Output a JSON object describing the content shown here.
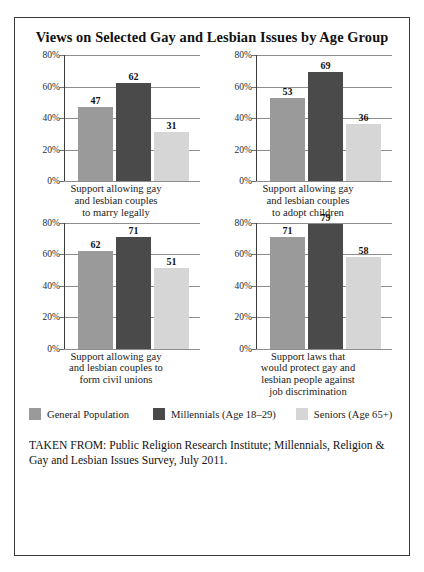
{
  "figure": {
    "title": "Views on Selected Gay and Lesbian Issues by Age Group",
    "source_caption": "TAKEN FROM: Public Religion Research Institute; Millennials, Religion & Gay and Lesbian Issues Survey, July 2011."
  },
  "legend": {
    "items": [
      {
        "label": "General Population",
        "color": "#9a9a9a"
      },
      {
        "label": "Millennials (Age 18–29)",
        "color": "#4a4a4a"
      },
      {
        "label": "Seniors (Age 65+)",
        "color": "#d6d6d6"
      }
    ]
  },
  "axis": {
    "ticks": [
      "80%",
      "60%",
      "40%",
      "20%",
      "0%"
    ]
  },
  "chart_data": [
    {
      "type": "bar",
      "title": "Support allowing gay and lesbian couples to marry legally",
      "caption_lines": [
        "Support allowing gay",
        "and lesbian couples",
        "to marry legally"
      ],
      "categories": [
        "General Population",
        "Millennials (Age 18–29)",
        "Seniors (Age 65+)"
      ],
      "values": [
        47,
        62,
        31
      ],
      "colors": [
        "#9a9a9a",
        "#4a4a4a",
        "#d6d6d6"
      ],
      "xlabel": "",
      "ylabel": "",
      "ylim": [
        0,
        80
      ],
      "yticks": [
        0,
        20,
        40,
        60,
        80
      ],
      "ytick_labels": [
        "0%",
        "20%",
        "40%",
        "60%",
        "80%"
      ],
      "grid": true,
      "legend_position": "bottom"
    },
    {
      "type": "bar",
      "title": "Support allowing gay and lesbian couples to adopt children",
      "caption_lines": [
        "Support allowing gay",
        "and lesbian couples",
        "to adopt children"
      ],
      "categories": [
        "General Population",
        "Millennials (Age 18–29)",
        "Seniors (Age 65+)"
      ],
      "values": [
        53,
        69,
        36
      ],
      "colors": [
        "#9a9a9a",
        "#4a4a4a",
        "#d6d6d6"
      ],
      "xlabel": "",
      "ylabel": "",
      "ylim": [
        0,
        80
      ],
      "yticks": [
        0,
        20,
        40,
        60,
        80
      ],
      "ytick_labels": [
        "0%",
        "20%",
        "40%",
        "60%",
        "80%"
      ],
      "grid": true,
      "legend_position": "bottom"
    },
    {
      "type": "bar",
      "title": "Support allowing gay and lesbian couples to form civil unions",
      "caption_lines": [
        "Support allowing gay",
        "and lesbian couples to",
        "form civil unions"
      ],
      "categories": [
        "General Population",
        "Millennials (Age 18–29)",
        "Seniors (Age 65+)"
      ],
      "values": [
        62,
        71,
        51
      ],
      "colors": [
        "#9a9a9a",
        "#4a4a4a",
        "#d6d6d6"
      ],
      "xlabel": "",
      "ylabel": "",
      "ylim": [
        0,
        80
      ],
      "yticks": [
        0,
        20,
        40,
        60,
        80
      ],
      "ytick_labels": [
        "0%",
        "20%",
        "40%",
        "60%",
        "80%"
      ],
      "grid": true,
      "legend_position": "bottom"
    },
    {
      "type": "bar",
      "title": "Support laws that would protect gay and lesbian people against job discrimination",
      "caption_lines": [
        "Support laws that",
        "would protect gay and",
        "lesbian people against",
        "job discrimination"
      ],
      "categories": [
        "General Population",
        "Millennials (Age 18–29)",
        "Seniors (Age 65+)"
      ],
      "values": [
        71,
        79,
        58
      ],
      "colors": [
        "#9a9a9a",
        "#4a4a4a",
        "#d6d6d6"
      ],
      "xlabel": "",
      "ylabel": "",
      "ylim": [
        0,
        80
      ],
      "yticks": [
        0,
        20,
        40,
        60,
        80
      ],
      "ytick_labels": [
        "0%",
        "20%",
        "40%",
        "60%",
        "80%"
      ],
      "grid": true,
      "legend_position": "bottom"
    }
  ]
}
